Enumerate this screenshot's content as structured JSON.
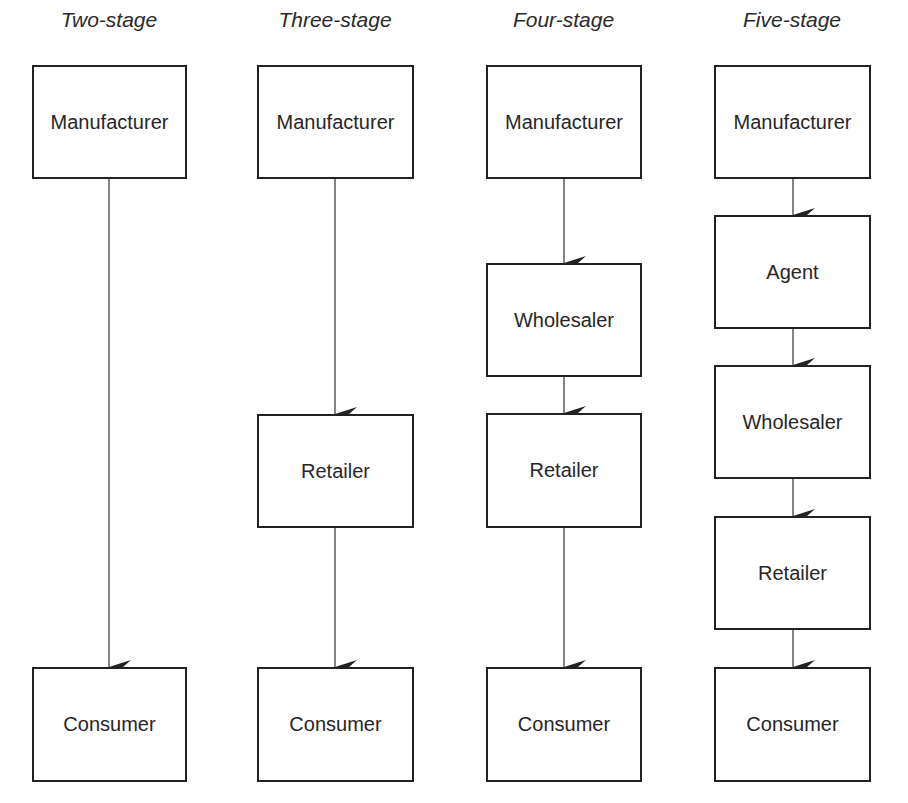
{
  "diagram": {
    "type": "flowchart",
    "columns": [
      {
        "title": "Two-stage",
        "nodes": [
          {
            "label": "Manufacturer",
            "top": 65,
            "height": 114
          },
          {
            "label": "Consumer",
            "top": 667,
            "height": 115
          }
        ]
      },
      {
        "title": "Three-stage",
        "nodes": [
          {
            "label": "Manufacturer",
            "top": 65,
            "height": 114
          },
          {
            "label": "Retailer",
            "top": 414,
            "height": 114
          },
          {
            "label": "Consumer",
            "top": 667,
            "height": 115
          }
        ]
      },
      {
        "title": "Four-stage",
        "nodes": [
          {
            "label": "Manufacturer",
            "top": 65,
            "height": 114
          },
          {
            "label": "Wholesaler",
            "top": 263,
            "height": 114
          },
          {
            "label": "Retailer",
            "top": 413,
            "height": 115
          },
          {
            "label": "Consumer",
            "top": 667,
            "height": 115
          }
        ]
      },
      {
        "title": "Five-stage",
        "nodes": [
          {
            "label": "Manufacturer",
            "top": 65,
            "height": 114
          },
          {
            "label": "Agent",
            "top": 215,
            "height": 114
          },
          {
            "label": "Wholesaler",
            "top": 365,
            "height": 114
          },
          {
            "label": "Retailer",
            "top": 516,
            "height": 114
          },
          {
            "label": "Consumer",
            "top": 667,
            "height": 115
          }
        ]
      }
    ],
    "edges": [
      {
        "column": 0,
        "from": "Manufacturer",
        "to": "Consumer"
      },
      {
        "column": 1,
        "from": "Manufacturer",
        "to": "Retailer"
      },
      {
        "column": 1,
        "from": "Retailer",
        "to": "Consumer"
      },
      {
        "column": 2,
        "from": "Manufacturer",
        "to": "Wholesaler"
      },
      {
        "column": 2,
        "from": "Wholesaler",
        "to": "Retailer"
      },
      {
        "column": 2,
        "from": "Retailer",
        "to": "Consumer"
      },
      {
        "column": 3,
        "from": "Manufacturer",
        "to": "Agent"
      },
      {
        "column": 3,
        "from": "Agent",
        "to": "Wholesaler"
      },
      {
        "column": 3,
        "from": "Wholesaler",
        "to": "Retailer"
      },
      {
        "column": 3,
        "from": "Retailer",
        "to": "Consumer"
      }
    ],
    "colors": {
      "stroke": "#222222",
      "text": "#262626",
      "background": "#ffffff"
    }
  }
}
